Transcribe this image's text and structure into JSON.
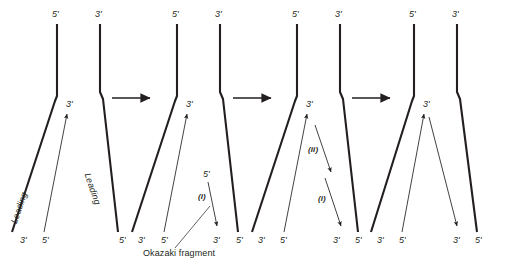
{
  "figure": {
    "stroke_color": "#231f20",
    "text_color": "#231f20",
    "background": "#ffffff",
    "step_arrow_count": 3
  },
  "panels": [
    {
      "id": "panel-1",
      "top_labels": [
        {
          "text": "5'",
          "x": 52,
          "y": 14
        },
        {
          "text": "3'",
          "x": 95,
          "y": 14
        }
      ],
      "fork_labels": [
        {
          "text": "3'",
          "x": 66,
          "y": 104
        }
      ],
      "strand_names": [
        {
          "text": "Leading",
          "x": 10,
          "y": 225,
          "angle": -64
        },
        {
          "text": "Leading",
          "x": 92,
          "y": 170,
          "angle": 64
        }
      ],
      "bottom_labels": [
        {
          "text": "3'",
          "x": 20,
          "y": 239
        },
        {
          "text": "5'",
          "x": 42,
          "y": 239
        },
        {
          "text": "5'",
          "x": 121,
          "y": 239
        }
      ],
      "okazaki_markers": []
    },
    {
      "id": "panel-2",
      "top_labels": [
        {
          "text": "5'",
          "x": 172,
          "y": 14
        },
        {
          "text": "3'",
          "x": 215,
          "y": 14
        }
      ],
      "fork_labels": [
        {
          "text": "3'",
          "x": 186,
          "y": 104
        }
      ],
      "strand_names": [],
      "bottom_labels": [
        {
          "text": "3'",
          "x": 140,
          "y": 239
        },
        {
          "text": "5'",
          "x": 163,
          "y": 239
        },
        {
          "text": "3'",
          "x": 215,
          "y": 239
        },
        {
          "text": "5'",
          "x": 238,
          "y": 239
        }
      ],
      "okazaki_markers": [
        {
          "text": "5'",
          "x": 203,
          "y": 174
        },
        {
          "text": "(i)",
          "x": 199,
          "y": 197
        }
      ],
      "caption": {
        "text": "Okazaki fragment",
        "x": 143,
        "y": 252
      }
    },
    {
      "id": "panel-3",
      "top_labels": [
        {
          "text": "5'",
          "x": 292,
          "y": 14
        },
        {
          "text": "3'",
          "x": 335,
          "y": 14
        }
      ],
      "fork_labels": [
        {
          "text": "3'",
          "x": 306,
          "y": 104
        }
      ],
      "strand_names": [],
      "bottom_labels": [
        {
          "text": "3'",
          "x": 260,
          "y": 239
        },
        {
          "text": "5'",
          "x": 282,
          "y": 239
        },
        {
          "text": "3'",
          "x": 335,
          "y": 239
        },
        {
          "text": "5'",
          "x": 357,
          "y": 239
        }
      ],
      "okazaki_markers": [
        {
          "text": "(ii)",
          "x": 310,
          "y": 150
        },
        {
          "text": "(i)",
          "x": 319,
          "y": 199
        }
      ]
    },
    {
      "id": "panel-4",
      "top_labels": [
        {
          "text": "5'",
          "x": 409,
          "y": 14
        },
        {
          "text": "3'",
          "x": 452,
          "y": 14
        }
      ],
      "fork_labels": [
        {
          "text": "3'",
          "x": 423,
          "y": 104
        }
      ],
      "strand_names": [],
      "bottom_labels": [
        {
          "text": "3'",
          "x": 379,
          "y": 239
        },
        {
          "text": "5'",
          "x": 400,
          "y": 239
        },
        {
          "text": "3'",
          "x": 455,
          "y": 239
        },
        {
          "text": "5'",
          "x": 477,
          "y": 239
        }
      ],
      "okazaki_markers": []
    }
  ],
  "step_arrows": [
    {
      "id": "step-arrow-1",
      "x1": 112,
      "y1": 98,
      "x2": 152,
      "y2": 98
    },
    {
      "id": "step-arrow-2",
      "x1": 233,
      "y1": 98,
      "x2": 273,
      "y2": 98
    },
    {
      "id": "step-arrow-3",
      "x1": 352,
      "y1": 98,
      "x2": 392,
      "y2": 98
    }
  ]
}
